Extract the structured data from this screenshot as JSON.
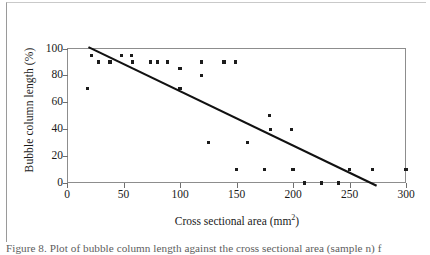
{
  "figure": {
    "caption": "Figure 8. Plot of bubble column length against the cross sectional area (sample n) f",
    "axes": {
      "y_title": "Bubble column length (%)",
      "x_title_prefix": "Cross sectional area (mm",
      "x_title_sup": "2",
      "x_title_suffix": ")"
    }
  },
  "chart_data": {
    "type": "scatter",
    "title": "",
    "xlabel": "Cross sectional area (mm²)",
    "ylabel": "Bubble column length (%)",
    "xlim": [
      0,
      300
    ],
    "ylim": [
      0,
      100
    ],
    "xticks": [
      0,
      50,
      100,
      150,
      200,
      250,
      300
    ],
    "yticks": [
      0,
      20,
      40,
      60,
      80,
      100
    ],
    "grid": false,
    "legend": "none",
    "marker": "filled-square",
    "marker_color": "#1c1c1c",
    "points": [
      {
        "x": 18,
        "y": 70
      },
      {
        "x": 22,
        "y": 95
      },
      {
        "x": 28,
        "y": 90
      },
      {
        "x": 38,
        "y": 90
      },
      {
        "x": 48,
        "y": 95
      },
      {
        "x": 57,
        "y": 95
      },
      {
        "x": 58,
        "y": 90
      },
      {
        "x": 74,
        "y": 90
      },
      {
        "x": 80,
        "y": 90
      },
      {
        "x": 89,
        "y": 90
      },
      {
        "x": 100,
        "y": 85
      },
      {
        "x": 100,
        "y": 70
      },
      {
        "x": 119,
        "y": 90
      },
      {
        "x": 119,
        "y": 80
      },
      {
        "x": 125,
        "y": 30
      },
      {
        "x": 139,
        "y": 90
      },
      {
        "x": 149,
        "y": 90
      },
      {
        "x": 150,
        "y": 10
      },
      {
        "x": 160,
        "y": 30
      },
      {
        "x": 175,
        "y": 10
      },
      {
        "x": 179,
        "y": 50
      },
      {
        "x": 180,
        "y": 40
      },
      {
        "x": 199,
        "y": 40
      },
      {
        "x": 200,
        "y": 10
      },
      {
        "x": 210,
        "y": 0
      },
      {
        "x": 225,
        "y": 0
      },
      {
        "x": 240,
        "y": 0
      },
      {
        "x": 250,
        "y": 10
      },
      {
        "x": 270,
        "y": 10
      },
      {
        "x": 300,
        "y": 10
      }
    ],
    "trendline": {
      "type": "linear",
      "color": "#111111",
      "x_start": 19,
      "y_start": 101,
      "x_end": 274,
      "y_end": -2
    }
  }
}
